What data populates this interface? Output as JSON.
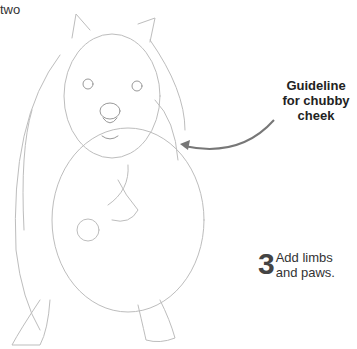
{
  "header": {
    "text": "two"
  },
  "callout": {
    "lines": [
      "Guideline",
      "for chubby",
      "cheek"
    ]
  },
  "step": {
    "number": "3",
    "lines": [
      "Add limbs",
      "and paws."
    ]
  },
  "colors": {
    "sketch_line": "#b8b8b8",
    "arrow": "#777777",
    "text": "#222222"
  }
}
